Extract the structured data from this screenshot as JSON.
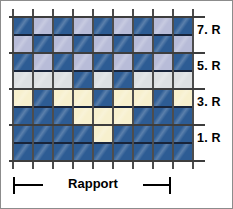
{
  "figure": {
    "kind": "knitting-pattern-chart",
    "border_color": "#8c8c8c"
  },
  "palette": {
    "dark_blue": "#2d5c94",
    "light_periwinkle": "#b8bcd8",
    "light_gray": "#dde0e2",
    "cream": "#f7f0ce",
    "grid_line": "#18243a",
    "rule_line": "#4d4d4d"
  },
  "row_labels": [
    {
      "text": "7. R",
      "top": 22
    },
    {
      "text": "5. R",
      "top": 58
    },
    {
      "text": "3. R",
      "top": 94
    },
    {
      "text": "1. R",
      "top": 130
    }
  ],
  "rapport": {
    "label": "Rapport",
    "start_x": 0,
    "end_x": 128
  },
  "chart_data": {
    "type": "heatmap",
    "title": "",
    "xlabel": "",
    "ylabel": "",
    "columns": 9,
    "rows": 8,
    "legend_position": "none",
    "grid": true,
    "color_keys": [
      "dark_blue",
      "light_periwinkle",
      "light_gray",
      "cream"
    ],
    "row_names": [
      "8. R",
      "7. R",
      "6. R",
      "5. R",
      "4. R",
      "3. R",
      "2. R",
      "1. R"
    ],
    "cells": [
      [
        "dark_blue",
        "light_periwinkle",
        "dark_blue",
        "light_periwinkle",
        "dark_blue",
        "light_periwinkle",
        "dark_blue",
        "light_periwinkle",
        "dark_blue"
      ],
      [
        "light_periwinkle",
        "dark_blue",
        "light_periwinkle",
        "dark_blue",
        "light_periwinkle",
        "dark_blue",
        "light_periwinkle",
        "dark_blue",
        "light_periwinkle"
      ],
      [
        "dark_blue",
        "light_periwinkle",
        "dark_blue",
        "light_periwinkle",
        "dark_blue",
        "light_periwinkle",
        "dark_blue",
        "light_periwinkle",
        "dark_blue"
      ],
      [
        "light_gray",
        "light_gray",
        "light_gray",
        "dark_blue",
        "light_gray",
        "dark_blue",
        "light_gray",
        "light_gray",
        "light_gray"
      ],
      [
        "cream",
        "dark_blue",
        "cream",
        "cream",
        "dark_blue",
        "cream",
        "cream",
        "dark_blue",
        "cream"
      ],
      [
        "dark_blue",
        "dark_blue",
        "dark_blue",
        "cream",
        "cream",
        "cream",
        "dark_blue",
        "dark_blue",
        "dark_blue"
      ],
      [
        "dark_blue",
        "dark_blue",
        "dark_blue",
        "dark_blue",
        "cream",
        "dark_blue",
        "dark_blue",
        "dark_blue",
        "dark_blue"
      ],
      [
        "dark_blue",
        "dark_blue",
        "dark_blue",
        "dark_blue",
        "dark_blue",
        "dark_blue",
        "dark_blue",
        "dark_blue",
        "dark_blue"
      ]
    ]
  }
}
